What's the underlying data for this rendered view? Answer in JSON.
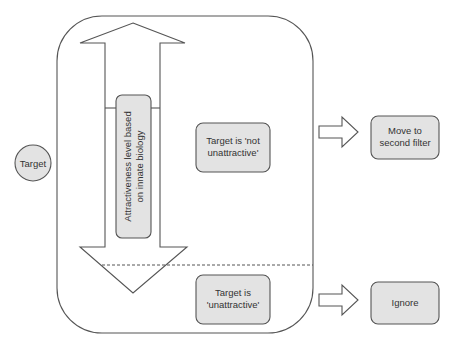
{
  "diagram": {
    "target_node": {
      "label": "Target"
    },
    "scale_label": {
      "lines": [
        "Attractiveness level based",
        "on innate biology"
      ]
    },
    "outcomes": {
      "not_unattractive": {
        "lines": [
          "Target is 'not",
          "unattractive'"
        ]
      },
      "unattractive": {
        "lines": [
          "Target is",
          "'unattractive'"
        ]
      }
    },
    "actions": {
      "second_filter": {
        "lines": [
          "Move to",
          "second filter"
        ]
      },
      "ignore": {
        "lines": [
          "Ignore"
        ]
      }
    },
    "colors": {
      "node_fill": "#e3e3e3",
      "stroke": "#555555",
      "text": "#333333",
      "background": "#ffffff"
    }
  }
}
